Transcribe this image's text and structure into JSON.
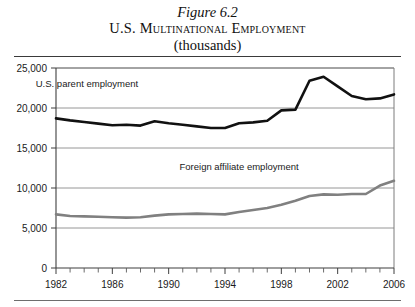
{
  "title": {
    "figure_number": "Figure 6.2",
    "main": "U.S. Multinational Employment",
    "subtitle": "(thousands)"
  },
  "chart_data": {
    "type": "line",
    "title": "U.S. Multinational Employment (thousands)",
    "xlabel": "",
    "ylabel": "",
    "ylim": [
      0,
      25000
    ],
    "xlim": [
      1982,
      2006
    ],
    "ytick_labels": [
      "0",
      "5,000",
      "10,000",
      "15,000",
      "20,000",
      "25,000"
    ],
    "yticks": [
      0,
      5000,
      10000,
      15000,
      20000,
      25000
    ],
    "xtick_labels": [
      "1982",
      "1986",
      "1990",
      "1994",
      "1998",
      "2002",
      "2006"
    ],
    "xticks": [
      1982,
      1986,
      1990,
      1994,
      1998,
      2002,
      2006
    ],
    "x_minor_step": 1,
    "grid": "horizontal",
    "legend": "inline-annotations",
    "x": [
      1982,
      1983,
      1984,
      1985,
      1986,
      1987,
      1988,
      1989,
      1990,
      1991,
      1992,
      1993,
      1994,
      1995,
      1996,
      1997,
      1998,
      1999,
      2000,
      2001,
      2002,
      2003,
      2004,
      2005,
      2006
    ],
    "series": [
      {
        "name": "U.S. parent employment",
        "color": "#111111",
        "width": 2.6,
        "label_x": 1984.2,
        "label_y": 22600,
        "values": [
          18700,
          18450,
          18250,
          18050,
          17850,
          17900,
          17800,
          18350,
          18100,
          17900,
          17700,
          17500,
          17500,
          18100,
          18200,
          18400,
          19700,
          19800,
          23400,
          23900,
          22700,
          21500,
          21100,
          21200,
          21700
        ]
      },
      {
        "name": "Foreign affiliate employment",
        "color": "#808080",
        "width": 2.6,
        "label_x": 1995.0,
        "label_y": 12300,
        "values": [
          6700,
          6500,
          6450,
          6400,
          6350,
          6300,
          6350,
          6550,
          6700,
          6750,
          6800,
          6750,
          6700,
          7000,
          7250,
          7500,
          7900,
          8400,
          9000,
          9200,
          9150,
          9250,
          9250,
          10300,
          10900
        ]
      }
    ]
  }
}
